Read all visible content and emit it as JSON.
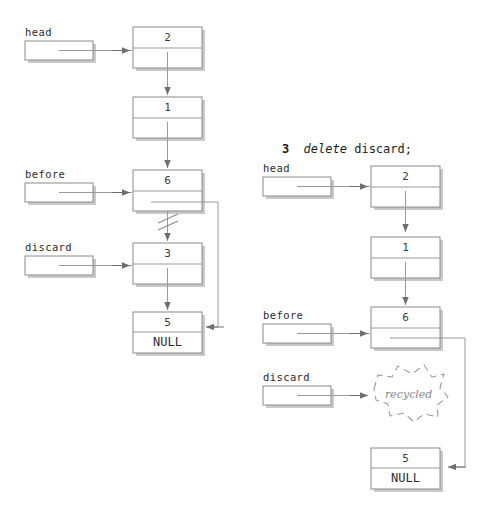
{
  "figure": {
    "title": "",
    "style": {
      "line": "#8a8a8a",
      "line_dark": "#6e6e6e",
      "text": "#2b2b2b",
      "shadow": "#bfbfbf",
      "dashed": "#9a9a9a",
      "bg": "#ffffff"
    }
  },
  "code": {
    "step_number": "3",
    "keyword": "delete",
    "statement": "discard;"
  },
  "left_diagram": {
    "name": "before-delete",
    "pointers": [
      {
        "id": "head",
        "label": "head"
      },
      {
        "id": "before",
        "label": "before"
      },
      {
        "id": "discard",
        "label": "discard"
      }
    ],
    "nodes": [
      {
        "id": "n2",
        "value": "2",
        "next": ""
      },
      {
        "id": "n1",
        "value": "1",
        "next": ""
      },
      {
        "id": "n6",
        "value": "6",
        "next": ""
      },
      {
        "id": "n3",
        "value": "3",
        "next": ""
      },
      {
        "id": "n5",
        "value": "5",
        "next": "NULL"
      }
    ],
    "cut_link": "severed-link-6-to-3"
  },
  "right_diagram": {
    "name": "after-delete",
    "pointers": [
      {
        "id": "head",
        "label": "head"
      },
      {
        "id": "before",
        "label": "before"
      },
      {
        "id": "discard",
        "label": "discard"
      }
    ],
    "nodes": [
      {
        "id": "n2",
        "value": "2",
        "next": ""
      },
      {
        "id": "n1",
        "value": "1",
        "next": ""
      },
      {
        "id": "n6",
        "value": "6",
        "next": ""
      },
      {
        "id": "n5",
        "value": "5",
        "next": "NULL"
      }
    ],
    "recycled_blob": {
      "label": "recycled"
    }
  }
}
